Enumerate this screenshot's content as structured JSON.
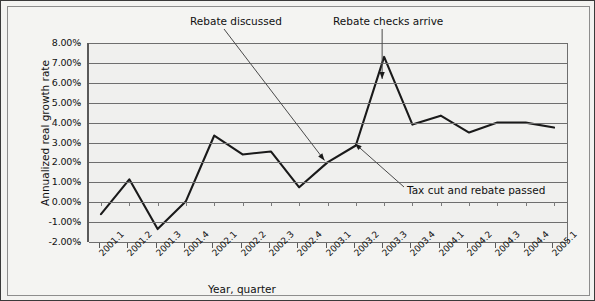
{
  "chart_data": {
    "type": "line",
    "title": "",
    "xlabel": "Year, quarter",
    "ylabel": "Annualized real growth rate",
    "categories": [
      "2001.1",
      "2001.2",
      "2001.3",
      "2001.4",
      "2002.1",
      "2002.2",
      "2002.3",
      "2002.4",
      "2003.1",
      "2003.2",
      "2003.3",
      "2003.4",
      "2004.1",
      "2004.2",
      "2004.3",
      "2004.4",
      "2005.1"
    ],
    "values": [
      -0.6,
      1.15,
      -1.35,
      0.05,
      3.35,
      2.4,
      2.55,
      0.75,
      2.0,
      2.85,
      7.3,
      3.9,
      4.35,
      3.5,
      4.0,
      4.0,
      3.75
    ],
    "ylim": [
      -2.0,
      8.0
    ],
    "ytick_values": [
      8.0,
      7.0,
      6.0,
      5.0,
      4.0,
      3.0,
      2.0,
      1.0,
      0.0,
      -1.0,
      -2.0
    ],
    "ytick_labels": [
      "8.00%",
      "7.00%",
      "6.00%",
      "5.00%",
      "4.00%",
      "3.00%",
      "2.00%",
      "1.00%",
      "0.00%",
      "-1.00%",
      "-2.00%"
    ],
    "grid": true,
    "legend": false,
    "series": [
      {
        "name": "Annualized real growth rate",
        "color": "#1a1a1a"
      }
    ],
    "annotations": [
      {
        "id": "rebate-discussed",
        "text": "Rebate discussed",
        "points_to": "2003.1"
      },
      {
        "id": "rebate-checks-arrive",
        "text": "Rebate checks arrive",
        "points_to": "2003.3"
      },
      {
        "id": "tax-cut-and-rebate-passed",
        "text": "Tax cut and rebate passed",
        "points_to": "2003.2"
      }
    ]
  },
  "axes": {
    "y_title": "Annualized real growth rate",
    "x_title": "Year, quarter"
  },
  "colors": {
    "line": "#1a1a1a",
    "grid": "#6e6e6e",
    "axis": "#5a5a5a",
    "plot_background": "#f0f0ee",
    "page_background": "#f3f3f1",
    "text": "#111111",
    "annotation_leader": "#4a4a4a"
  }
}
